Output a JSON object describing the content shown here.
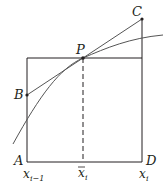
{
  "diagram": {
    "type": "geometry-figure",
    "colors": {
      "line": "#231f20",
      "curve": "#555555",
      "dash": "#231f20"
    },
    "points": {
      "A": {
        "label": "A"
      },
      "B": {
        "label": "B"
      },
      "C": {
        "label": "C"
      },
      "D": {
        "label": "D"
      },
      "P": {
        "label": "P"
      }
    },
    "axis_labels": {
      "left": {
        "base": "x",
        "sub": "i−1"
      },
      "mid": {
        "base": "x",
        "sub": "i",
        "overbar": true
      },
      "right": {
        "base": "x",
        "sub": "i"
      }
    }
  }
}
